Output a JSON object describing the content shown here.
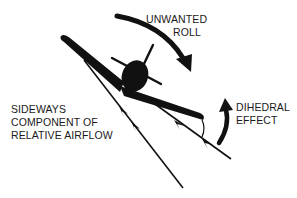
{
  "diagram": {
    "labels": {
      "unwanted_roll": {
        "line1": "UNWANTED",
        "line2": "ROLL"
      },
      "dihedral_effect": {
        "line1": "DIHEDRAL",
        "line2": "EFFECT"
      },
      "sideways_airflow": {
        "line1": "SIDEWAYS",
        "line2": "COMPONENT OF",
        "line3": "RELATIVE AIRFLOW"
      }
    },
    "colors": {
      "ink": "#111111",
      "background": "#ffffff"
    },
    "elements": [
      "aircraft-front-view",
      "propeller",
      "left-wing-raised",
      "right-wing-lowered",
      "unwanted-roll-arrow",
      "dihedral-effect-arrow",
      "sideways-airflow-lines",
      "dihedral-angle-arc"
    ]
  }
}
